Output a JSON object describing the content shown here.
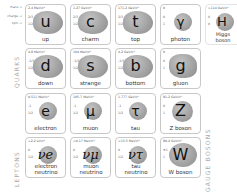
{
  "legend": {
    "mass": "mass →",
    "charge": "charge →",
    "spin": "spin →"
  },
  "groups": {
    "quarks": "QUARKS",
    "leptons": "LEPTONS",
    "gauge_bosons": "GAUGE BOSONS"
  },
  "particles": {
    "up": {
      "mass": "2.4 MeV/c²",
      "charge": "2/3",
      "spin": "1/2",
      "symbol": "u",
      "name": "up"
    },
    "charm": {
      "mass": "1.27 GeV/c²",
      "charge": "2/3",
      "spin": "1/2",
      "symbol": "c",
      "name": "charm"
    },
    "top": {
      "mass": "171.2 GeV/c²",
      "charge": "2/3",
      "spin": "1/2",
      "symbol": "t",
      "name": "top"
    },
    "photon": {
      "mass": "0",
      "charge": "0",
      "spin": "1",
      "symbol": "γ",
      "name": "photon"
    },
    "higgs": {
      "mass": ">114 GeV/c²",
      "charge": "0",
      "spin": "0",
      "symbol": "H",
      "name": "Higgs boson"
    },
    "down": {
      "mass": "4.8 MeV/c²",
      "charge": "-1/3",
      "spin": "1/2",
      "symbol": "d",
      "name": "down"
    },
    "strange": {
      "mass": "104 MeV/c²",
      "charge": "-1/3",
      "spin": "1/2",
      "symbol": "s",
      "name": "strange"
    },
    "bottom": {
      "mass": "4.2 GeV/c²",
      "charge": "-1/3",
      "spin": "1/2",
      "symbol": "b",
      "name": "bottom"
    },
    "gluon": {
      "mass": "0",
      "charge": "0",
      "spin": "1",
      "symbol": "g",
      "name": "gluon"
    },
    "electron": {
      "mass": "0.511 MeV/c²",
      "charge": "-1",
      "spin": "1/2",
      "symbol": "e",
      "name": "electron"
    },
    "muon": {
      "mass": "105.7 MeV/c²",
      "charge": "-1",
      "spin": "1/2",
      "symbol": "μ",
      "name": "muon"
    },
    "tau": {
      "mass": "1.777 GeV/c²",
      "charge": "-1",
      "spin": "1/2",
      "symbol": "τ",
      "name": "tau"
    },
    "zboson": {
      "mass": "91.2 GeV/c²",
      "charge": "0",
      "spin": "1",
      "symbol": "Z",
      "name": "Z boson"
    },
    "enu": {
      "mass": "<2.2 eV/c²",
      "charge": "0",
      "spin": "1/2",
      "symbol": "νe",
      "name": "electron neutrino"
    },
    "munu": {
      "mass": "<0.17 MeV/c²",
      "charge": "0",
      "spin": "1/2",
      "symbol": "νμ",
      "name": "muon neutrino"
    },
    "taunu": {
      "mass": "<15.5 MeV/c²",
      "charge": "0",
      "spin": "1/2",
      "symbol": "ντ",
      "name": "tau neutrino"
    },
    "wboson": {
      "mass": "80.4 GeV/c²",
      "charge": "±1",
      "spin": "1",
      "symbol": "W",
      "name": "W boson"
    }
  }
}
